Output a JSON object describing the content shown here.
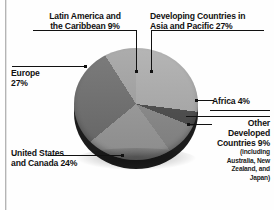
{
  "chart_data": {
    "type": "pie",
    "title": "",
    "categories": [
      "Developing Countries in Asia and Pacific",
      "Africa",
      "Other Developed Countries",
      "United States and Canada",
      "Europe",
      "Latin America and the Caribbean"
    ],
    "values": [
      27,
      4,
      9,
      24,
      27,
      9
    ],
    "value_unit": "%",
    "legend": "none",
    "labels_position": "callout-leader-lines",
    "slice_colors": [
      "#adadad",
      "#4a4a4a",
      "#8a8a8a",
      "#9b9b9b",
      "#6e6e6e",
      "#a3a3a3"
    ],
    "style": "3d-grayscale",
    "total": 100
  },
  "labels": {
    "latin_america": {
      "line1": "Latin America and",
      "line2": "the Caribbean  9%",
      "value": "9%"
    },
    "developing_asia": {
      "line1": "Developing Countries in",
      "line2": "Asia and Pacific  27%",
      "value": "27%"
    },
    "europe": {
      "line1": "Europe",
      "line2": "27%",
      "value": "27%"
    },
    "africa": {
      "line1": "Africa   4%",
      "value": "4%"
    },
    "other_developed": {
      "line1": "Other",
      "line2": "Developed",
      "line3": "Countries  9%",
      "note1": "(including",
      "note2": "Australia, New",
      "note3": "Zealand, and",
      "note4": "Japan)",
      "value": "9%"
    },
    "united_states": {
      "line1": "United States",
      "line2": "and Canada  24%",
      "value": "24%"
    }
  }
}
